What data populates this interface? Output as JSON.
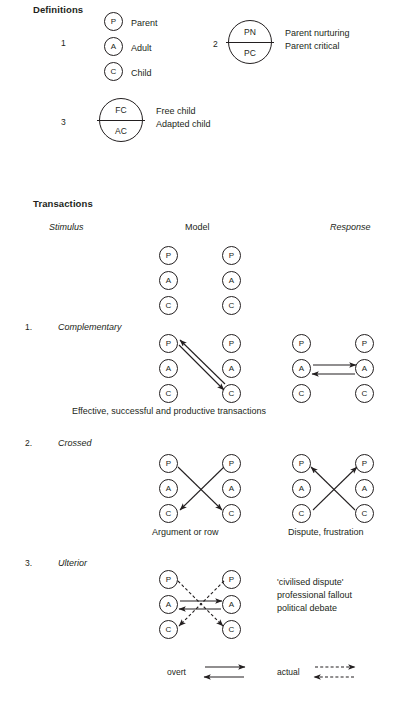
{
  "definitions": {
    "heading": "Definitions",
    "groups": [
      {
        "number": "1",
        "states": [
          {
            "code": "P",
            "label": "Parent"
          },
          {
            "code": "A",
            "label": "Adult"
          },
          {
            "code": "C",
            "label": "Child"
          }
        ]
      },
      {
        "number": "2",
        "top_code": "PN",
        "bottom_code": "PC",
        "top_label": "Parent nurturing",
        "bottom_label": "Parent critical"
      },
      {
        "number": "3",
        "top_code": "FC",
        "bottom_code": "AC",
        "top_label": "Free child",
        "bottom_label": "Adapted child"
      }
    ]
  },
  "transactions": {
    "heading": "Transactions",
    "columns": {
      "stimulus": "Stimulus",
      "model": "Model",
      "response": "Response"
    },
    "model_states": [
      "P",
      "A",
      "C"
    ],
    "items": [
      {
        "number": "1.",
        "label": "Complementary",
        "caption": "Effective, successful and productive transactions",
        "left_states": [
          "P",
          "A",
          "C"
        ],
        "right_states": [
          "P",
          "A",
          "C"
        ]
      },
      {
        "number": "2.",
        "label": "Crossed",
        "left_caption": "Argument or row",
        "right_caption": "Dispute, frustration",
        "left_states": [
          "P",
          "A",
          "C"
        ],
        "right_states": [
          "P",
          "A",
          "C"
        ]
      },
      {
        "number": "3.",
        "label": "Ulterior",
        "outcomes": [
          "'civilised dispute'",
          "professional fallout",
          "political debate"
        ],
        "left_states": [
          "P",
          "A",
          "C"
        ],
        "right_states": [
          "P",
          "A",
          "C"
        ]
      }
    ]
  },
  "legend": {
    "overt": "overt",
    "actual": "actual"
  },
  "colors": {
    "ink": "#231f20",
    "background": "#ffffff"
  }
}
